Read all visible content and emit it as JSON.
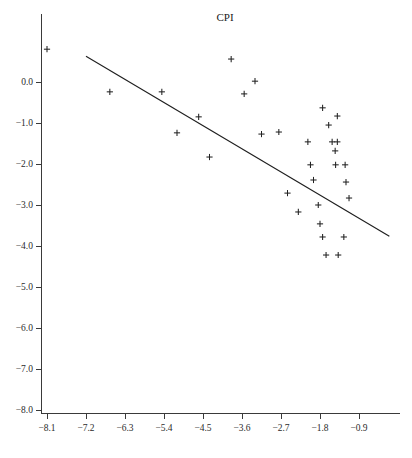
{
  "chart_data": {
    "type": "scatter",
    "title": "CPI",
    "xlabel": "",
    "ylabel": "",
    "grid": false,
    "legend": null,
    "xlim": [
      -8.55,
      -0.55
    ],
    "ylim": [
      -8.15,
      1.05
    ],
    "xticks": [
      -8.1,
      -7.2,
      -6.3,
      -5.4,
      -4.5,
      -3.6,
      -2.7,
      -1.8,
      -0.9
    ],
    "xticklabels": [
      "-8.1",
      "-7.2",
      "-6.3",
      "-5.4",
      "-4.5",
      "-3.6",
      "-2.7",
      "-1.8",
      "-0.9"
    ],
    "yticks": [
      0.0,
      -1.0,
      -2.0,
      -3.0,
      -4.0,
      -5.0,
      -6.0,
      -7.0,
      -8.0
    ],
    "yticklabels": [
      "0.0",
      "-1.0",
      "-2.0",
      "-3.0",
      "-4.0",
      "-5.0",
      "-6.0",
      "-7.0",
      "-8.0"
    ],
    "marker": "plus",
    "marker_color": "#222222",
    "line_color": "#1f1f1f",
    "points": [
      {
        "x": -8.1,
        "y": 0.8
      },
      {
        "x": -6.65,
        "y": -0.24
      },
      {
        "x": -5.45,
        "y": -0.24
      },
      {
        "x": -5.1,
        "y": -1.24
      },
      {
        "x": -4.6,
        "y": -0.85
      },
      {
        "x": -4.35,
        "y": -1.83
      },
      {
        "x": -3.85,
        "y": 0.56
      },
      {
        "x": -3.55,
        "y": -0.29
      },
      {
        "x": -3.3,
        "y": 0.02
      },
      {
        "x": -3.15,
        "y": -1.27
      },
      {
        "x": -2.75,
        "y": -1.22
      },
      {
        "x": -2.55,
        "y": -2.71
      },
      {
        "x": -2.3,
        "y": -3.17
      },
      {
        "x": -2.08,
        "y": -1.46
      },
      {
        "x": -1.95,
        "y": -2.39
      },
      {
        "x": -1.84,
        "y": -3.0
      },
      {
        "x": -1.8,
        "y": -3.46
      },
      {
        "x": -1.74,
        "y": -3.78
      },
      {
        "x": -1.66,
        "y": -4.22
      },
      {
        "x": -1.38,
        "y": -4.22
      },
      {
        "x": -1.74,
        "y": -0.63
      },
      {
        "x": -1.6,
        "y": -1.05
      },
      {
        "x": -1.52,
        "y": -1.46
      },
      {
        "x": -1.4,
        "y": -1.46
      },
      {
        "x": -1.45,
        "y": -1.68
      },
      {
        "x": -1.4,
        "y": -0.83
      },
      {
        "x": -1.44,
        "y": -2.02
      },
      {
        "x": -1.22,
        "y": -2.02
      },
      {
        "x": -1.2,
        "y": -2.44
      },
      {
        "x": -1.13,
        "y": -2.83
      },
      {
        "x": -1.25,
        "y": -3.78
      },
      {
        "x": -2.02,
        "y": -2.02
      }
    ],
    "fit_line": {
      "label": "regression line",
      "x_start": -7.2,
      "y_start": 0.63,
      "x_end": -0.2,
      "y_end": -3.76
    }
  }
}
